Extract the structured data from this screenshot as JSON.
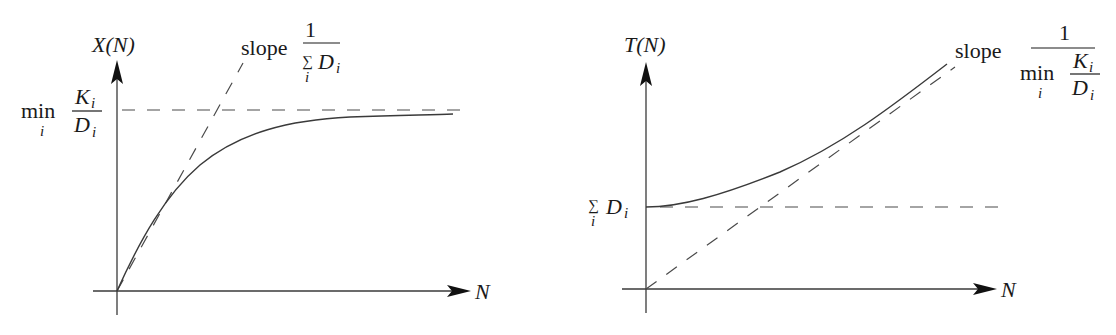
{
  "left_plot": {
    "y_axis_label": "X(N)",
    "x_axis_label": "N",
    "asymptote_label": {
      "prefix": "min",
      "index": "i",
      "numerator": "K",
      "numerator_sub": "i",
      "denominator": "D",
      "denominator_sub": "i"
    },
    "slope_label": {
      "word": "slope",
      "numerator": "1",
      "sum_symbol": "∑",
      "sum_index": "i",
      "denominator": "D",
      "denominator_sub": "i"
    }
  },
  "right_plot": {
    "y_axis_label": "T(N)",
    "x_axis_label": "N",
    "intercept_label": {
      "sum_symbol": "∑",
      "sum_index": "i",
      "term": "D",
      "term_sub": "i"
    },
    "slope_label": {
      "word": "slope",
      "numerator": "1",
      "min_word": "min",
      "min_index": "i",
      "inner_numerator": "K",
      "inner_numerator_sub": "i",
      "inner_denominator": "D",
      "inner_denominator_sub": "i"
    }
  },
  "colors": {
    "line": "#3a3a3a",
    "arrow": "#111111",
    "text": "#1a1a1a",
    "background": "#ffffff"
  }
}
